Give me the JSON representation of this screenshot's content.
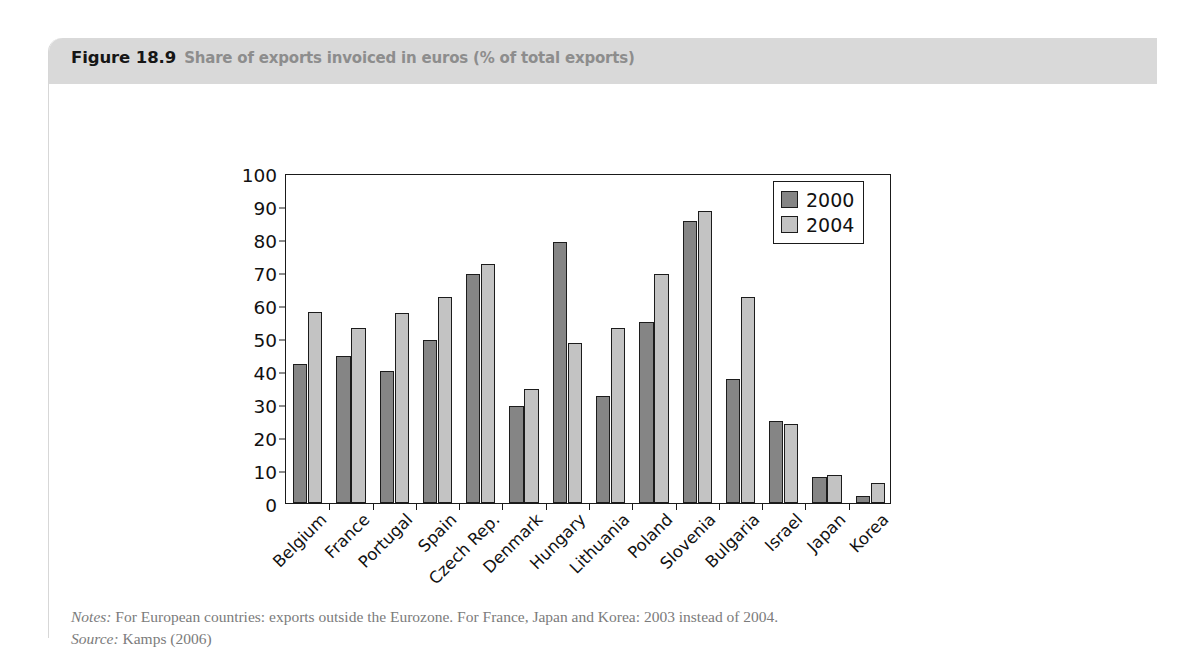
{
  "figure": {
    "number": "Figure 18.9",
    "title": "Share of exports invoiced in euros (% of total exports)",
    "notes_label": "Notes:",
    "notes_text": "For European countries: exports outside the Eurozone. For France, Japan and Korea: 2003 instead of 2004.",
    "source_label": "Source:",
    "source_text": "Kamps (2006)"
  },
  "colors": {
    "header_band": "#d9d9d9",
    "series_2000": "#858585",
    "series_2004": "#c3c3c3",
    "axis": "#1a1a1a",
    "note_text": "#7b7b7b"
  },
  "chart_data": {
    "type": "bar",
    "title": "Share of exports invoiced in euros (% of total exports)",
    "xlabel": "",
    "ylabel": "",
    "ylim": [
      0,
      100
    ],
    "yticks": [
      0,
      10,
      20,
      30,
      40,
      50,
      60,
      70,
      80,
      90,
      100
    ],
    "ytick_labels": [
      "0",
      "10",
      "20",
      "30",
      "40",
      "50",
      "60",
      "70",
      "80",
      "90",
      "100"
    ],
    "grid": false,
    "legend_position": "top-right",
    "categories": [
      "Belgium",
      "France",
      "Portugal",
      "Spain",
      "Czech Rep.",
      "Denmark",
      "Hungary",
      "Lithuania",
      "Poland",
      "Slovenia",
      "Bulgaria",
      "Israel",
      "Japan",
      "Korea"
    ],
    "series": [
      {
        "name": "2000",
        "color": "#858585",
        "values": [
          42,
          44.5,
          40,
          49.5,
          69.5,
          29.5,
          79,
          32.5,
          55,
          85.5,
          37.5,
          25,
          8,
          2
        ]
      },
      {
        "name": "2004",
        "color": "#c3c3c3",
        "values": [
          58,
          53,
          57.5,
          62.5,
          72.5,
          34.5,
          48.5,
          53,
          69.5,
          88.5,
          62.5,
          24,
          8.5,
          6
        ]
      }
    ]
  }
}
